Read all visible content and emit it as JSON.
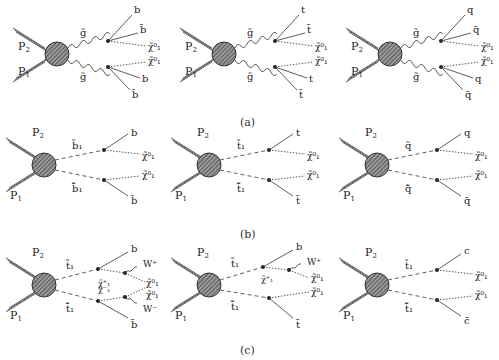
{
  "figure": {
    "captions": {
      "a": "(a)",
      "b": "(b)",
      "c": "(c)"
    },
    "incoming": {
      "p1": "P",
      "p1_sub": "1",
      "p2": "P",
      "p2_sub": "2"
    },
    "rows": {
      "a": [
        {
          "id": "a1",
          "prop_top": "g̃",
          "prop_bot": "g̃",
          "out": [
            "b",
            "b̄",
            "χ̃⁰₁",
            "χ̃⁰₁",
            "b",
            "b̄"
          ]
        },
        {
          "id": "a2",
          "prop_top": "g̃",
          "prop_bot": "g̃",
          "out": [
            "t",
            "t̄",
            "χ̃⁰₁",
            "χ̃⁰₁",
            "t",
            "t̄"
          ]
        },
        {
          "id": "a3",
          "prop_top": "g̃",
          "prop_bot": "g̃",
          "out": [
            "q",
            "q̄",
            "χ̃⁰₁",
            "χ̃⁰₁",
            "q",
            "q̄"
          ]
        }
      ],
      "b": [
        {
          "id": "b1",
          "prop_top": "b̃₁",
          "prop_bot": "b̃̄₁",
          "out": [
            "b",
            "χ̃⁰₁",
            "χ̃⁰₁",
            "b̄"
          ]
        },
        {
          "id": "b2",
          "prop_top": "t̃₁",
          "prop_bot": "t̃̄₁",
          "out": [
            "t",
            "χ̃⁰₁",
            "χ̃⁰₁",
            "t̄"
          ]
        },
        {
          "id": "b3",
          "prop_top": "q̃",
          "prop_bot": "q̃̄",
          "out": [
            "q",
            "χ̃⁰₁",
            "χ̃⁰₁",
            "q̄"
          ]
        }
      ],
      "c": [
        {
          "id": "c1",
          "prop_top": "t̃₁",
          "prop_bot": "t̃̄₁",
          "mid_top": "χ̃⁺₁",
          "mid_bot": "χ̃⁻₁",
          "out": [
            "b",
            "W⁺",
            "χ̃⁰₁",
            "χ̃⁰₁",
            "W⁻",
            "b̄"
          ]
        },
        {
          "id": "c2",
          "prop_top": "t̃₁",
          "prop_bot": "t̃̄₁",
          "mid_top": "χ̃⁺₁",
          "out": [
            "b",
            "W⁺",
            "χ̃⁰₁",
            "χ̃⁰₁",
            "t̄"
          ]
        },
        {
          "id": "c3",
          "prop_top": "t̃₁",
          "prop_bot": "t̃̄₁",
          "out": [
            "c",
            "χ̃⁰₁",
            "χ̃⁰₁",
            "c̄"
          ]
        }
      ]
    },
    "colors": {
      "line": "#2a2a2a",
      "hatch_fill": "#777777",
      "background": "#ffffff"
    }
  }
}
